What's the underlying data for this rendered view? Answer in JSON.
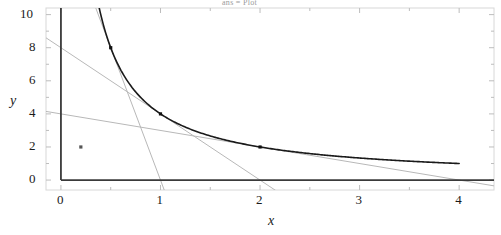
{
  "title": "ans = Plot",
  "chart_data": {
    "type": "line",
    "title": "ans = Plot",
    "xlabel": "x",
    "ylabel": "y",
    "xlim": [
      -0.15,
      4.35
    ],
    "ylim": [
      -0.6,
      10.4
    ],
    "grid": false,
    "legend_position": "none",
    "xticks": [
      0,
      1,
      2,
      3,
      4
    ],
    "xtick_labels": [
      "0",
      "1",
      "2",
      "3",
      "4"
    ],
    "yticks": [
      0,
      2,
      4,
      6,
      8,
      10
    ],
    "ytick_labels": [
      "0",
      "2",
      "4",
      "6",
      "8",
      "10"
    ],
    "x_minor_ticks": [
      0.5,
      1.5,
      2.5,
      3.5
    ],
    "y_minor_ticks": [
      1,
      3,
      5,
      7,
      9
    ],
    "series": [
      {
        "name": "y = 4/x",
        "type": "curve",
        "color": "#1a1a1a",
        "width": 1.6,
        "formula": "4/x",
        "x_start": 0.38,
        "x_end": 4.0,
        "points": [
          {
            "x": 0.4,
            "y": 10.0
          },
          {
            "x": 0.5,
            "y": 8.0
          },
          {
            "x": 0.6,
            "y": 6.67
          },
          {
            "x": 0.7,
            "y": 5.71
          },
          {
            "x": 0.8,
            "y": 5.0
          },
          {
            "x": 0.9,
            "y": 4.44
          },
          {
            "x": 1.0,
            "y": 4.0
          },
          {
            "x": 1.25,
            "y": 3.2
          },
          {
            "x": 1.5,
            "y": 2.67
          },
          {
            "x": 1.75,
            "y": 2.29
          },
          {
            "x": 2.0,
            "y": 2.0
          },
          {
            "x": 2.5,
            "y": 1.6
          },
          {
            "x": 3.0,
            "y": 1.33
          },
          {
            "x": 3.5,
            "y": 1.14
          },
          {
            "x": 4.0,
            "y": 1.0
          }
        ]
      },
      {
        "name": "tangent at x = 0.5",
        "type": "line",
        "color": "#b8b8b8",
        "width": 1.0,
        "x0": 0.0,
        "y0": 16.0,
        "x1": 1.0,
        "y1": 0.0,
        "tangent_point": {
          "x": 0.5,
          "y": 8.0
        }
      },
      {
        "name": "tangent at x = 1",
        "type": "line",
        "color": "#b8b8b8",
        "width": 1.0,
        "x0": 0.0,
        "y0": 8.0,
        "x1": 2.0,
        "y1": 0.0,
        "tangent_point": {
          "x": 1.0,
          "y": 4.0
        }
      },
      {
        "name": "tangent at x = 2",
        "type": "line",
        "color": "#b8b8b8",
        "width": 1.0,
        "x0": 0.0,
        "y0": 4.0,
        "x1": 4.0,
        "y1": 0.0,
        "tangent_point": {
          "x": 2.0,
          "y": 2.0
        }
      }
    ],
    "markers": [
      {
        "x": 0.5,
        "y": 8.0,
        "color": "#111111"
      },
      {
        "x": 1.0,
        "y": 4.0,
        "color": "#111111"
      },
      {
        "x": 2.0,
        "y": 2.0,
        "color": "#111111"
      },
      {
        "x": 0.2,
        "y": 2.0,
        "color": "#555555"
      }
    ],
    "axes": {
      "x_axis_color": "#3a3a3a",
      "y_axis_color": "#3a3a3a",
      "frame_color": "#d8d8d8"
    }
  }
}
